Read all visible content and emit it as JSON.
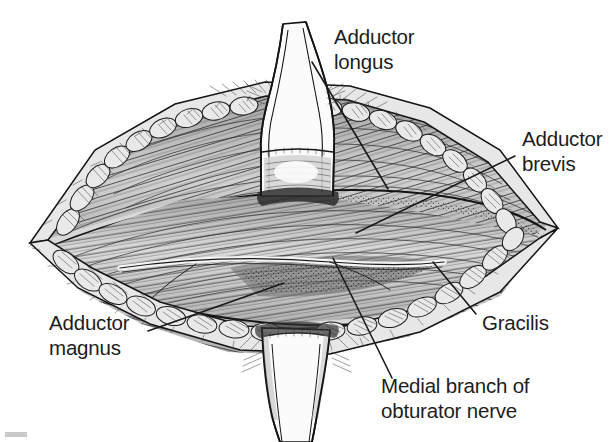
{
  "figure": {
    "kind": "anatomical-line-drawing",
    "background_color": "#ffffff",
    "ink_color": "#141414",
    "label_color": "#1d1d1d",
    "labels": [
      {
        "id": "adductor-longus",
        "lines": [
          "Adductor",
          "longus"
        ],
        "text_x": 334,
        "text_y": 44,
        "anchor": "start",
        "leader": {
          "x1": 312,
          "y1": 62,
          "x2": 388,
          "y2": 189
        }
      },
      {
        "id": "adductor-brevis",
        "lines": [
          "Adductor",
          "brevis"
        ],
        "text_x": 522,
        "text_y": 146,
        "anchor": "start",
        "leader": {
          "x1": 515,
          "y1": 156,
          "x2": 356,
          "y2": 233
        }
      },
      {
        "id": "gracilis",
        "lines": [
          "Gracilis"
        ],
        "text_x": 482,
        "text_y": 330,
        "anchor": "start",
        "leader": {
          "x1": 476,
          "y1": 314,
          "x2": 433,
          "y2": 262
        }
      },
      {
        "id": "medial-branch-obturator-nerve",
        "lines": [
          "Medial branch of",
          "obturator nerve"
        ],
        "text_x": 381,
        "text_y": 393,
        "anchor": "start",
        "leader": {
          "x1": 392,
          "y1": 378,
          "x2": 333,
          "y2": 258
        }
      },
      {
        "id": "adductor-magnus",
        "lines": [
          "Adductor",
          "magnus"
        ],
        "text_x": 49,
        "text_y": 330,
        "anchor": "start",
        "leader": {
          "x1": 148,
          "y1": 331,
          "x2": 284,
          "y2": 283
        }
      }
    ],
    "structures": [
      {
        "id": "wound-outline",
        "name": "skin incision margin"
      },
      {
        "id": "subcutaneous-fat-upper",
        "name": "subcutaneous fat lobules, upper margin"
      },
      {
        "id": "subcutaneous-fat-lower",
        "name": "subcutaneous fat lobules, lower margin"
      },
      {
        "id": "adductor-longus-belly",
        "name": "adductor longus muscle belly"
      },
      {
        "id": "adductor-brevis-belly",
        "name": "adductor brevis muscle belly"
      },
      {
        "id": "adductor-magnus-belly",
        "name": "adductor magnus muscle belly"
      },
      {
        "id": "gracilis-belly",
        "name": "gracilis muscle belly"
      },
      {
        "id": "obturator-nerve-branch",
        "name": "medial branch of obturator nerve"
      },
      {
        "id": "tendon-retracted-upper",
        "name": "retracted tendon flap, superior"
      },
      {
        "id": "tendon-retracted-lower",
        "name": "retracted tendon flap, inferior"
      }
    ],
    "corner_mark": {
      "present": true,
      "color": "#c9c9c9"
    }
  }
}
